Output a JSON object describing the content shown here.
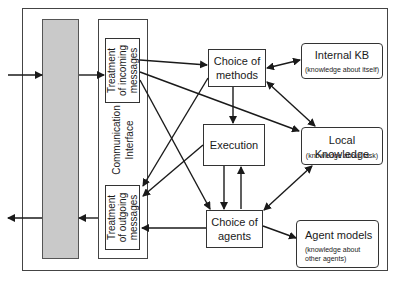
{
  "diagram": {
    "communication_interface": {
      "label_line1": "Communication",
      "label_line2": "Interface",
      "incoming": {
        "line1": "Treatment",
        "line2": "of incoming",
        "line3": "messages"
      },
      "outgoing": {
        "line1": "Treatment",
        "line2": "of outgoing",
        "line3": "messages"
      }
    },
    "nodes": {
      "choice_of_methods": {
        "line1": "Choice of",
        "line2": "methods"
      },
      "execution": {
        "label": "Execution"
      },
      "choice_of_agents": {
        "line1": "Choice of",
        "line2": "agents"
      },
      "internal_kb": {
        "title": "Internal KB",
        "subtitle": "(knowledge about itself)"
      },
      "local_knowledge": {
        "title": "Local Knowledge",
        "subtitle": "(knowledge about task)"
      },
      "agent_models": {
        "title": "Agent models",
        "subtitle_line1": "(knowledge about",
        "subtitle_line2": "other agents)"
      }
    },
    "colors": {
      "line": "#1a1a1a",
      "grey_bar": "#c9c9c9",
      "frame": "#444444"
    }
  }
}
